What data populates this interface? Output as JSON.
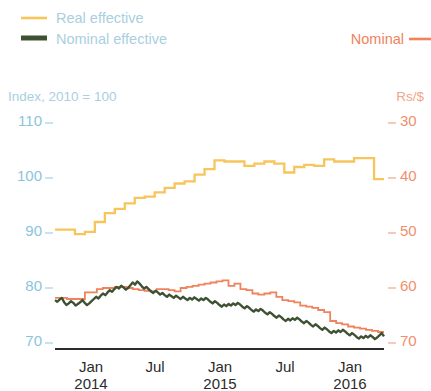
{
  "legend": {
    "items": [
      {
        "label": "Real effective",
        "color": "#f7c55c",
        "style": "thin"
      },
      {
        "label": "Nominal effective",
        "color": "#3e5132",
        "style": "thick"
      }
    ],
    "right": {
      "label": "Nominal",
      "color": "#f0825c"
    }
  },
  "axes": {
    "left_title": "Index, 2010 = 100",
    "right_title": "Rs/$",
    "left_ticks": [
      "110",
      "100",
      "90",
      "80",
      "70"
    ],
    "right_ticks": [
      "30",
      "40",
      "50",
      "60",
      "70"
    ],
    "x_ticks": [
      {
        "month": "Jan",
        "year": "2014"
      },
      {
        "month": "Jul",
        "year": ""
      },
      {
        "month": "Jan",
        "year": "2015"
      },
      {
        "month": "Jul",
        "year": ""
      },
      {
        "month": "Jan",
        "year": "2016"
      }
    ]
  },
  "chart_data": {
    "type": "line",
    "title": "",
    "subtitle": "",
    "xlabel": "",
    "ylabel": "Index, 2010 = 100",
    "y2label": "Rs/$",
    "grid": false,
    "legend_position": "top",
    "x_range": [
      "2013-10",
      "2016-06"
    ],
    "ylim": [
      65,
      115
    ],
    "y2lim": [
      25,
      75
    ],
    "y2_inverted": true,
    "ytick_values": [
      110,
      100,
      90,
      80,
      70
    ],
    "y2tick_values": [
      30,
      40,
      50,
      60,
      70
    ],
    "xtick_labels": [
      "Jan 2014",
      "Jul",
      "Jan 2015",
      "Jul",
      "Jan 2016"
    ],
    "series": [
      {
        "name": "Real effective",
        "axis": "left",
        "color": "#f7c55c",
        "drawstyle": "steps-post",
        "x": [
          "2013-10",
          "2013-11",
          "2013-12",
          "2014-01",
          "2014-02",
          "2014-03",
          "2014-04",
          "2014-05",
          "2014-06",
          "2014-07",
          "2014-08",
          "2014-09",
          "2014-10",
          "2014-11",
          "2014-12",
          "2015-01",
          "2015-02",
          "2015-03",
          "2015-04",
          "2015-05",
          "2015-06",
          "2015-07",
          "2015-08",
          "2015-09",
          "2015-10",
          "2015-11",
          "2015-12",
          "2016-01",
          "2016-02",
          "2016-03",
          "2016-04",
          "2016-05",
          "2016-06"
        ],
        "values": [
          90.6,
          90.6,
          89.8,
          90.2,
          92.0,
          93.6,
          94.4,
          95.4,
          96.4,
          96.6,
          97.4,
          98.2,
          99.0,
          99.4,
          100.6,
          101.6,
          103.2,
          103.0,
          103.0,
          102.2,
          102.6,
          103.0,
          102.6,
          101.0,
          102.0,
          102.4,
          102.2,
          103.4,
          103.0,
          103.0,
          103.6,
          103.6,
          99.8
        ]
      },
      {
        "name": "Nominal effective",
        "axis": "left",
        "color": "#3e5132",
        "drawstyle": "daily",
        "values": [
          77.8,
          77.5,
          77.9,
          78.2,
          77.4,
          76.9,
          77.2,
          77.6,
          77.3,
          76.8,
          77.1,
          77.4,
          77.8,
          77.3,
          76.9,
          77.2,
          77.6,
          78.0,
          78.4,
          78.1,
          78.6,
          79.0,
          78.7,
          79.2,
          79.6,
          79.3,
          79.8,
          80.2,
          79.9,
          80.4,
          80.1,
          79.7,
          80.0,
          80.5,
          81.0,
          80.6,
          81.2,
          80.8,
          80.3,
          79.9,
          80.2,
          79.8,
          79.4,
          79.1,
          79.5,
          79.2,
          78.8,
          79.1,
          78.7,
          78.4,
          78.8,
          78.5,
          78.2,
          78.6,
          78.3,
          78.0,
          78.4,
          78.1,
          77.8,
          78.2,
          77.9,
          78.3,
          78.0,
          77.7,
          78.1,
          77.8,
          78.2,
          77.9,
          77.5,
          77.2,
          77.6,
          77.3,
          76.9,
          76.6,
          77.0,
          76.7,
          77.1,
          76.8,
          77.2,
          76.9,
          77.3,
          77.0,
          76.6,
          76.3,
          76.7,
          76.4,
          76.0,
          75.7,
          76.1,
          75.8,
          76.2,
          75.9,
          75.5,
          75.2,
          75.6,
          75.3,
          74.9,
          74.6,
          75.0,
          74.7,
          74.3,
          74.0,
          74.4,
          74.1,
          74.5,
          74.2,
          74.6,
          74.3,
          73.9,
          73.6,
          74.0,
          73.7,
          73.3,
          73.0,
          73.4,
          73.1,
          72.7,
          72.4,
          72.8,
          72.5,
          72.1,
          71.8,
          72.2,
          71.9,
          72.3,
          72.0,
          72.4,
          72.1,
          71.7,
          71.4,
          71.8,
          71.5,
          71.1,
          70.8,
          71.2,
          70.9,
          71.3,
          71.0,
          71.4,
          71.1,
          70.7,
          71.0,
          71.4,
          71.8,
          71.2
        ]
      },
      {
        "name": "Nominal",
        "axis": "right",
        "color": "#f0825c",
        "drawstyle": "steps-post",
        "values": [
          61.8,
          61.8,
          62.0,
          62.0,
          62.0,
          60.8,
          60.8,
          60.2,
          60.0,
          60.0,
          59.8,
          59.8,
          60.0,
          60.2,
          60.4,
          60.5,
          60.6,
          60.2,
          60.2,
          60.4,
          60.6,
          60.0,
          59.8,
          59.6,
          59.4,
          59.2,
          59.0,
          58.8,
          58.6,
          59.6,
          59.2,
          60.2,
          60.4,
          61.0,
          61.2,
          61.0,
          60.8,
          61.6,
          62.2,
          62.4,
          62.6,
          63.2,
          63.4,
          63.6,
          64.0,
          64.4,
          66.0,
          66.4,
          66.6,
          67.0,
          67.2,
          67.4,
          67.6,
          67.8,
          68.0
        ]
      }
    ]
  }
}
